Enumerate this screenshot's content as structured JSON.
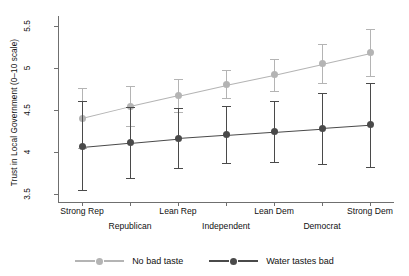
{
  "chart_data": {
    "type": "line",
    "title": "",
    "xlabel": "",
    "ylabel": "Trust in Local Government (0–10 scale)",
    "categories": [
      "Strong Rep",
      "Republican",
      "Lean Rep",
      "Independent",
      "Lean Dem",
      "Democrat",
      "Strong Dem"
    ],
    "category_rows": [
      0,
      1,
      0,
      1,
      0,
      1,
      0
    ],
    "ylim": [
      3.4,
      5.62
    ],
    "yticks": [
      3.5,
      4,
      4.5,
      5,
      5.5
    ],
    "ytick_labels": [
      "3.5",
      "4",
      "4.5",
      "5",
      "5.5"
    ],
    "grid": false,
    "legend_position": "bottom",
    "series": [
      {
        "name": "No bad taste",
        "color": "#b4b4b4",
        "marker": "diamond-circle",
        "values": [
          4.4,
          4.54,
          4.67,
          4.8,
          4.92,
          5.05,
          5.18
        ],
        "err_low": [
          4.04,
          4.31,
          4.48,
          4.64,
          4.73,
          4.82,
          4.9
        ],
        "err_high": [
          4.76,
          4.78,
          4.87,
          4.97,
          5.11,
          5.29,
          5.47
        ]
      },
      {
        "name": "Water tastes bad",
        "color": "#4a4a4a",
        "marker": "circle",
        "values": [
          4.06,
          4.11,
          4.16,
          4.2,
          4.24,
          4.28,
          4.32
        ],
        "err_low": [
          3.54,
          3.69,
          3.8,
          3.87,
          3.88,
          3.85,
          3.82
        ],
        "err_high": [
          4.6,
          4.53,
          4.52,
          4.54,
          4.6,
          4.7,
          4.82
        ]
      }
    ]
  },
  "legend": {
    "items": [
      {
        "label": "No bad taste",
        "color": "#b4b4b4"
      },
      {
        "label": "Water tastes bad",
        "color": "#4a4a4a"
      }
    ]
  }
}
